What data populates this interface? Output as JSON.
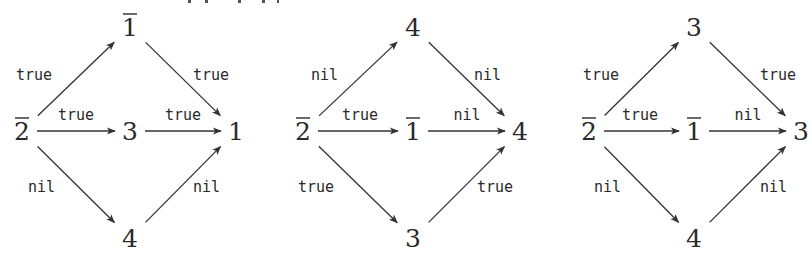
{
  "diagrams": [
    {
      "id": "left",
      "nodes": {
        "src": {
          "label": "2",
          "overline": true,
          "x": 22,
          "y": 131
        },
        "top": {
          "label": "1",
          "overline": true,
          "x": 130,
          "y": 27
        },
        "mid": {
          "label": "3",
          "overline": false,
          "x": 130,
          "y": 131
        },
        "bot": {
          "label": "4",
          "overline": false,
          "x": 130,
          "y": 238
        },
        "sink": {
          "label": "1",
          "overline": false,
          "x": 236,
          "y": 131
        }
      },
      "edges": [
        {
          "from": "src",
          "to": "top",
          "label": "true",
          "lx": 16,
          "ly": 80,
          "anchor": "start"
        },
        {
          "from": "src",
          "to": "mid",
          "label": "true",
          "lx": 76,
          "ly": 120,
          "anchor": "middle"
        },
        {
          "from": "src",
          "to": "bot",
          "label": "nil",
          "lx": 28,
          "ly": 192,
          "anchor": "start"
        },
        {
          "from": "top",
          "to": "sink",
          "label": "true",
          "lx": 193,
          "ly": 80,
          "anchor": "start"
        },
        {
          "from": "mid",
          "to": "sink",
          "label": "true",
          "lx": 183,
          "ly": 120,
          "anchor": "middle"
        },
        {
          "from": "bot",
          "to": "sink",
          "label": "nil",
          "lx": 193,
          "ly": 192,
          "anchor": "start"
        }
      ]
    },
    {
      "id": "middle",
      "nodes": {
        "src": {
          "label": "2",
          "overline": true,
          "x": 303,
          "y": 131
        },
        "top": {
          "label": "4",
          "overline": false,
          "x": 413,
          "y": 27
        },
        "mid": {
          "label": "1",
          "overline": true,
          "x": 413,
          "y": 131
        },
        "bot": {
          "label": "3",
          "overline": false,
          "x": 413,
          "y": 238
        },
        "sink": {
          "label": "4",
          "overline": false,
          "x": 520,
          "y": 131
        }
      },
      "edges": [
        {
          "from": "src",
          "to": "top",
          "label": "nil",
          "lx": 311,
          "ly": 80,
          "anchor": "start"
        },
        {
          "from": "src",
          "to": "mid",
          "label": "true",
          "lx": 360,
          "ly": 120,
          "anchor": "middle"
        },
        {
          "from": "src",
          "to": "bot",
          "label": "true",
          "lx": 298,
          "ly": 192,
          "anchor": "start"
        },
        {
          "from": "top",
          "to": "sink",
          "label": "nil",
          "lx": 474,
          "ly": 80,
          "anchor": "start"
        },
        {
          "from": "mid",
          "to": "sink",
          "label": "nil",
          "lx": 467,
          "ly": 120,
          "anchor": "middle"
        },
        {
          "from": "bot",
          "to": "sink",
          "label": "true",
          "lx": 477,
          "ly": 192,
          "anchor": "start"
        }
      ]
    },
    {
      "id": "right",
      "nodes": {
        "src": {
          "label": "2",
          "overline": true,
          "x": 589,
          "y": 131
        },
        "top": {
          "label": "3",
          "overline": false,
          "x": 694,
          "y": 27
        },
        "mid": {
          "label": "1",
          "overline": true,
          "x": 694,
          "y": 131
        },
        "bot": {
          "label": "4",
          "overline": false,
          "x": 694,
          "y": 238
        },
        "sink": {
          "label": "3",
          "overline": false,
          "x": 801,
          "y": 131
        }
      },
      "edges": [
        {
          "from": "src",
          "to": "top",
          "label": "true",
          "lx": 583,
          "ly": 80,
          "anchor": "start"
        },
        {
          "from": "src",
          "to": "mid",
          "label": "true",
          "lx": 640,
          "ly": 120,
          "anchor": "middle"
        },
        {
          "from": "src",
          "to": "bot",
          "label": "nil",
          "lx": 594,
          "ly": 192,
          "anchor": "start"
        },
        {
          "from": "top",
          "to": "sink",
          "label": "true",
          "lx": 760,
          "ly": 80,
          "anchor": "start"
        },
        {
          "from": "mid",
          "to": "sink",
          "label": "nil",
          "lx": 748,
          "ly": 120,
          "anchor": "middle"
        },
        {
          "from": "bot",
          "to": "sink",
          "label": "nil",
          "lx": 760,
          "ly": 192,
          "anchor": "start"
        }
      ]
    }
  ]
}
